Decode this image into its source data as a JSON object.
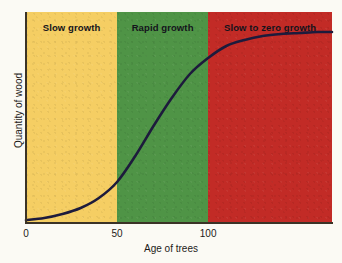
{
  "chart_data": {
    "type": "line",
    "title": "",
    "xlabel": "Age of trees",
    "ylabel": "Quantity of wood",
    "xlim": [
      0,
      168
    ],
    "ylim": [
      0,
      1.05
    ],
    "grid": false,
    "legend_position": "none",
    "xticks": [
      "0",
      "50",
      "100"
    ],
    "xtick_values": [
      0,
      50,
      100
    ],
    "yticks": [],
    "series": [
      {
        "name": "Quantity of wood",
        "color": "#1d1b3c",
        "x": [
          0,
          10,
          20,
          30,
          40,
          50,
          60,
          70,
          80,
          90,
          100,
          110,
          120,
          130,
          140,
          150,
          160,
          168
        ],
        "y": [
          0.01,
          0.02,
          0.04,
          0.07,
          0.12,
          0.2,
          0.33,
          0.48,
          0.62,
          0.74,
          0.82,
          0.88,
          0.91,
          0.93,
          0.94,
          0.945,
          0.95,
          0.95
        ]
      }
    ],
    "bands": [
      {
        "id": "slow",
        "label": "Slow growth",
        "x_start": 0,
        "x_end": 50,
        "color": "#f5ce63"
      },
      {
        "id": "rapid",
        "label": "Rapid growth",
        "x_start": 50,
        "x_end": 100,
        "color": "#4f9446"
      },
      {
        "id": "zero",
        "label": "Slow to zero growth",
        "x_start": 100,
        "x_end": 168,
        "color": "#c22b26"
      }
    ]
  },
  "axis": {
    "x_title": "Age of trees",
    "y_title": "Quantity of wood",
    "ticks": {
      "t0": "0",
      "t50": "50",
      "t100": "100"
    }
  },
  "bands": {
    "slow": "Slow growth",
    "rapid": "Rapid growth",
    "zero": "Slow to zero growth"
  },
  "colors": {
    "slow_growth": "#f5ce63",
    "rapid_growth": "#4f9446",
    "zero_growth": "#c22b26",
    "curve": "#1d1b3c",
    "axis": "#3b3326",
    "page": "#fbfaf4"
  }
}
